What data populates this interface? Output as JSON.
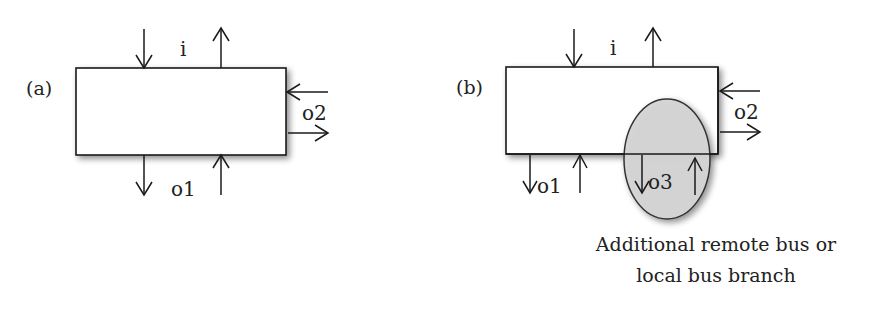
{
  "panels": [
    {
      "id": "a",
      "label": "(a)",
      "top_label": "i",
      "right_label": "o2",
      "bottom_label": "o1"
    },
    {
      "id": "b",
      "label": "(b)",
      "top_label": "i",
      "right_label": "o2",
      "bottom_label": "o1",
      "ellipse_label": "o3",
      "caption_line1": "Additional remote bus or",
      "caption_line2": "local bus branch"
    }
  ],
  "colors": {
    "stroke": "#1a1a1a",
    "box_fill": "#ffffff",
    "ellipse_fill": "#d4d4d4",
    "shadow": "#9a9a9a"
  }
}
